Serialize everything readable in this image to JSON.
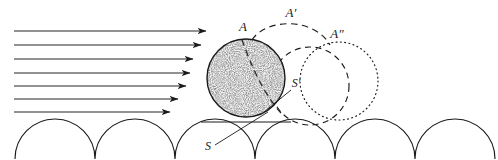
{
  "figure": {
    "background_color": "#ffffff",
    "ink_color": "#1a1a1a",
    "width": 498,
    "height": 160
  },
  "labels": {
    "sphere_initial": "A",
    "sphere_mid": "A′",
    "sphere_final": "A″",
    "contact_initial": "S",
    "contact_final": "S′"
  },
  "flow": {
    "name": "airflow-arrows",
    "count": 7,
    "direction": "left-to-right",
    "arrows": [
      {
        "y": 31,
        "x1": 14,
        "x2": 206
      },
      {
        "y": 45,
        "x1": 14,
        "x2": 201
      },
      {
        "y": 59,
        "x1": 14,
        "x2": 193
      },
      {
        "y": 73,
        "x1": 14,
        "x2": 190
      },
      {
        "y": 86,
        "x1": 14,
        "x2": 186
      },
      {
        "y": 99,
        "x1": 14,
        "x2": 178
      },
      {
        "y": 112,
        "x1": 14,
        "x2": 170
      }
    ]
  },
  "spheres": [
    {
      "id": "A",
      "name": "sphere-initial",
      "cx": 246,
      "cy": 78,
      "r": 39,
      "style": "solid-stippled"
    },
    {
      "id": "A-prime",
      "name": "sphere-final",
      "cx": 339,
      "cy": 81,
      "r": 39,
      "style": "dotted"
    }
  ],
  "dashed_circle": {
    "name": "sphere-mid-dashed",
    "cx": 310,
    "cy": 86,
    "r": 39,
    "style": "dashed"
  },
  "trajectory": {
    "name": "saltation-trajectory",
    "style": "dashed",
    "from": [
      252,
      40
    ],
    "apex": [
      291,
      21
    ],
    "to": [
      330,
      45
    ]
  },
  "bed": {
    "name": "rough-bed",
    "bump_radius": 40,
    "bump_centers_x": [
      55,
      135,
      215,
      295,
      375,
      455
    ],
    "baseline_y": 158,
    "cusp_y": 155
  },
  "ground_line": {
    "name": "reference-baseline",
    "x1": 201,
    "x2": 291,
    "y": 122
  },
  "leaders": {
    "s_leader": {
      "from": [
        215,
        145
      ],
      "to": [
        268,
        112
      ]
    },
    "s2_leader": {
      "from": [
        291,
        90
      ],
      "to": [
        265,
        112
      ]
    }
  },
  "chord": {
    "name": "internal-dashed-chord",
    "from": [
      242,
      40
    ],
    "to": [
      281,
      113
    ]
  }
}
